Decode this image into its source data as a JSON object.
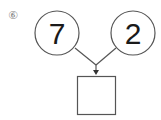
{
  "problem": {
    "label": "⑥",
    "left_circle": {
      "value": "7"
    },
    "right_circle": {
      "value": "2"
    },
    "answer_box": {
      "value": ""
    }
  },
  "colors": {
    "stroke": "#555555",
    "text": "#1a1a1a",
    "label": "#888888"
  }
}
